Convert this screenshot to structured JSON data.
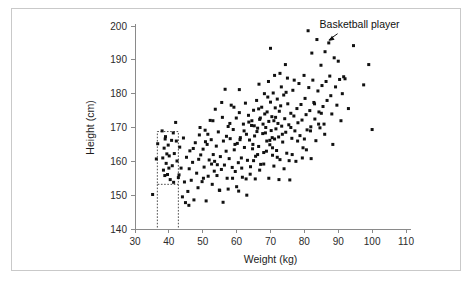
{
  "chart_data": {
    "type": "scatter",
    "title": "",
    "xlabel": "Weight (kg)",
    "ylabel": "Height (cm)",
    "xlim": [
      30,
      110
    ],
    "ylim": [
      140,
      200
    ],
    "xticks": [
      30,
      40,
      50,
      60,
      70,
      80,
      90,
      100,
      110
    ],
    "yticks": [
      140,
      150,
      160,
      170,
      180,
      190,
      200
    ],
    "grid": false,
    "legend": null,
    "point_color": "#111111",
    "point_size_px": 2.1,
    "annotations": [
      {
        "label": "Basketball player",
        "text_x": 84.5,
        "text_y": 199.5,
        "target_x": 87.2,
        "target_y": 195.0
      }
    ],
    "selection_box": {
      "name": "dotted-selection-rectangle",
      "x_range": [
        36.6,
        42.8
      ],
      "y_range": [
        153.2,
        168.8
      ],
      "drop_line_x": 36.6,
      "drop_line_to_y": 140
    },
    "points": [
      [
        35.2,
        150.2
      ],
      [
        36.3,
        160.7
      ],
      [
        36.7,
        165.2
      ],
      [
        38.0,
        169.0
      ],
      [
        38.2,
        161.0
      ],
      [
        38.4,
        157.4
      ],
      [
        38.6,
        163.9
      ],
      [
        38.8,
        155.8
      ],
      [
        39.0,
        167.3
      ],
      [
        39.2,
        159.4
      ],
      [
        39.6,
        156.1
      ],
      [
        39.8,
        164.8
      ],
      [
        40.1,
        161.6
      ],
      [
        40.4,
        154.6
      ],
      [
        40.8,
        166.2
      ],
      [
        41.0,
        158.7
      ],
      [
        41.3,
        168.4
      ],
      [
        41.6,
        162.3
      ],
      [
        42.0,
        171.5
      ],
      [
        42.4,
        160.1
      ],
      [
        42.8,
        155.2
      ],
      [
        43.2,
        164.2
      ],
      [
        43.6,
        158.0
      ],
      [
        44.0,
        149.5
      ],
      [
        44.3,
        166.9
      ],
      [
        44.6,
        153.9
      ],
      [
        44.9,
        147.8
      ],
      [
        45.2,
        161.2
      ],
      [
        45.6,
        151.1
      ],
      [
        45.9,
        147.0
      ],
      [
        46.2,
        163.1
      ],
      [
        46.6,
        154.4
      ],
      [
        47.0,
        159.7
      ],
      [
        47.4,
        148.6
      ],
      [
        47.8,
        165.5
      ],
      [
        48.2,
        156.5
      ],
      [
        48.6,
        152.2
      ],
      [
        49.0,
        167.8
      ],
      [
        49.4,
        161.9
      ],
      [
        49.8,
        154.0
      ],
      [
        50.1,
        163.6
      ],
      [
        50.4,
        158.3
      ],
      [
        50.7,
        169.2
      ],
      [
        51.0,
        148.3
      ],
      [
        51.3,
        165.0
      ],
      [
        51.6,
        155.6
      ],
      [
        51.9,
        160.4
      ],
      [
        52.2,
        172.1
      ],
      [
        52.5,
        166.4
      ],
      [
        52.8,
        153.2
      ],
      [
        53.1,
        162.0
      ],
      [
        53.4,
        157.1
      ],
      [
        53.7,
        175.4
      ],
      [
        54.0,
        164.5
      ],
      [
        54.3,
        159.0
      ],
      [
        54.6,
        168.7
      ],
      [
        54.9,
        151.5
      ],
      [
        55.2,
        161.4
      ],
      [
        55.5,
        157.6
      ],
      [
        55.8,
        173.0
      ],
      [
        56.1,
        166.0
      ],
      [
        56.4,
        158.9
      ],
      [
        56.6,
        181.3
      ],
      [
        56.9,
        163.0
      ],
      [
        57.2,
        155.0
      ],
      [
        57.5,
        170.3
      ],
      [
        57.8,
        160.8
      ],
      [
        58.1,
        166.7
      ],
      [
        58.4,
        176.6
      ],
      [
        58.7,
        158.2
      ],
      [
        59.0,
        169.4
      ],
      [
        59.3,
        163.4
      ],
      [
        59.6,
        157.0
      ],
      [
        59.9,
        172.8
      ],
      [
        60.2,
        165.3
      ],
      [
        60.5,
        159.6
      ],
      [
        60.8,
        174.4
      ],
      [
        61.1,
        167.0
      ],
      [
        61.4,
        161.0
      ],
      [
        61.7,
        155.3
      ],
      [
        62.0,
        171.0
      ],
      [
        62.3,
        164.1
      ],
      [
        62.6,
        177.2
      ],
      [
        62.9,
        168.0
      ],
      [
        63.2,
        160.3
      ],
      [
        63.5,
        173.6
      ],
      [
        63.8,
        166.3
      ],
      [
        64.1,
        158.4
      ],
      [
        64.4,
        170.6
      ],
      [
        64.7,
        163.7
      ],
      [
        65.0,
        175.1
      ],
      [
        65.3,
        167.5
      ],
      [
        65.6,
        161.5
      ],
      [
        65.9,
        178.0
      ],
      [
        66.2,
        169.8
      ],
      [
        66.5,
        164.4
      ],
      [
        66.8,
        172.4
      ],
      [
        67.1,
        159.1
      ],
      [
        67.4,
        176.0
      ],
      [
        67.7,
        168.2
      ],
      [
        68.0,
        162.6
      ],
      [
        68.3,
        174.0
      ],
      [
        68.6,
        170.0
      ],
      [
        68.9,
        166.0
      ],
      [
        69.2,
        179.0
      ],
      [
        69.5,
        171.8
      ],
      [
        69.8,
        164.9
      ],
      [
        70.0,
        177.5
      ],
      [
        70.2,
        169.1
      ],
      [
        70.4,
        173.2
      ],
      [
        70.6,
        161.8
      ],
      [
        70.8,
        180.2
      ],
      [
        71.0,
        172.0
      ],
      [
        71.2,
        166.6
      ],
      [
        71.4,
        175.8
      ],
      [
        71.6,
        169.6
      ],
      [
        71.8,
        163.2
      ],
      [
        72.0,
        178.4
      ],
      [
        72.2,
        171.2
      ],
      [
        72.4,
        167.2
      ],
      [
        72.6,
        174.8
      ],
      [
        72.8,
        160.5
      ],
      [
        73.0,
        176.4
      ],
      [
        73.3,
        170.4
      ],
      [
        73.6,
        165.7
      ],
      [
        73.9,
        179.6
      ],
      [
        74.2,
        172.6
      ],
      [
        74.5,
        168.6
      ],
      [
        74.8,
        162.4
      ],
      [
        75.1,
        177.0
      ],
      [
        75.4,
        170.8
      ],
      [
        75.7,
        154.5
      ],
      [
        76.0,
        174.2
      ],
      [
        76.3,
        166.8
      ],
      [
        76.6,
        181.0
      ],
      [
        76.9,
        173.4
      ],
      [
        77.2,
        169.0
      ],
      [
        77.5,
        160.0
      ],
      [
        77.8,
        175.6
      ],
      [
        78.1,
        171.4
      ],
      [
        78.4,
        183.0
      ],
      [
        78.7,
        167.6
      ],
      [
        79.0,
        176.8
      ],
      [
        79.3,
        172.2
      ],
      [
        79.6,
        164.0
      ],
      [
        79.9,
        185.4
      ],
      [
        80.2,
        178.6
      ],
      [
        80.5,
        173.8
      ],
      [
        80.8,
        169.3
      ],
      [
        81.1,
        198.6
      ],
      [
        81.3,
        181.8
      ],
      [
        81.6,
        175.0
      ],
      [
        81.9,
        170.2
      ],
      [
        82.2,
        192.0
      ],
      [
        82.5,
        184.0
      ],
      [
        82.8,
        177.4
      ],
      [
        83.1,
        172.5
      ],
      [
        83.4,
        166.1
      ],
      [
        83.7,
        196.0
      ],
      [
        84.0,
        180.8
      ],
      [
        84.3,
        174.6
      ],
      [
        84.6,
        169.9
      ],
      [
        84.9,
        188.4
      ],
      [
        85.2,
        182.4
      ],
      [
        85.5,
        176.2
      ],
      [
        85.8,
        171.0
      ],
      [
        86.1,
        192.4
      ],
      [
        86.4,
        183.6
      ],
      [
        86.7,
        178.0
      ],
      [
        87.2,
        195.0
      ],
      [
        87.5,
        185.2
      ],
      [
        87.8,
        179.4
      ],
      [
        88.1,
        174.0
      ],
      [
        88.4,
        165.0
      ],
      [
        88.8,
        190.6
      ],
      [
        89.2,
        182.0
      ],
      [
        89.6,
        176.6
      ],
      [
        90.0,
        189.6
      ],
      [
        90.4,
        184.2
      ],
      [
        90.8,
        172.0
      ],
      [
        91.2,
        180.0
      ],
      [
        91.6,
        185.0
      ],
      [
        92.0,
        184.4
      ],
      [
        93.0,
        175.6
      ],
      [
        94.5,
        194.2
      ],
      [
        97.5,
        182.6
      ],
      [
        99.0,
        188.6
      ],
      [
        100.0,
        169.4
      ],
      [
        53.5,
        160.0
      ],
      [
        54.2,
        155.8
      ],
      [
        55.0,
        151.4
      ],
      [
        56.0,
        147.9
      ],
      [
        57.5,
        151.8
      ],
      [
        58.8,
        155.0
      ],
      [
        60.0,
        152.5
      ],
      [
        61.5,
        158.0
      ],
      [
        62.8,
        154.8
      ],
      [
        64.0,
        156.2
      ],
      [
        65.5,
        154.8
      ],
      [
        66.8,
        157.4
      ],
      [
        68.0,
        159.2
      ],
      [
        69.5,
        155.0
      ],
      [
        71.0,
        158.6
      ],
      [
        72.5,
        154.6
      ],
      [
        74.0,
        157.8
      ],
      [
        75.5,
        160.2
      ],
      [
        63.0,
        150.0
      ],
      [
        60.6,
        151.2
      ],
      [
        46.0,
        157.8
      ],
      [
        47.2,
        163.8
      ],
      [
        48.8,
        160.6
      ],
      [
        50.2,
        155.0
      ],
      [
        51.5,
        168.0
      ],
      [
        52.6,
        159.2
      ],
      [
        43.0,
        156.0
      ],
      [
        42.2,
        166.0
      ],
      [
        41.4,
        153.8
      ],
      [
        40.0,
        158.0
      ],
      [
        39.4,
        162.2
      ],
      [
        38.9,
        166.6
      ],
      [
        64.5,
        172.0
      ],
      [
        65.2,
        170.5
      ],
      [
        66.0,
        168.8
      ],
      [
        67.0,
        172.8
      ],
      [
        68.5,
        168.4
      ],
      [
        69.0,
        174.6
      ],
      [
        70.5,
        167.0
      ],
      [
        71.5,
        173.0
      ],
      [
        73.5,
        168.0
      ],
      [
        66.5,
        175.5
      ],
      [
        67.8,
        171.0
      ],
      [
        69.8,
        166.2
      ],
      [
        64.8,
        165.0
      ],
      [
        62.2,
        169.0
      ],
      [
        63.6,
        171.6
      ],
      [
        61.0,
        166.4
      ],
      [
        59.5,
        165.0
      ],
      [
        58.0,
        171.2
      ],
      [
        57.0,
        167.4
      ],
      [
        74.6,
        180.4
      ],
      [
        76.0,
        170.0
      ],
      [
        78.0,
        166.0
      ],
      [
        80.0,
        166.6
      ],
      [
        81.8,
        169.0
      ],
      [
        83.0,
        177.0
      ],
      [
        85.0,
        174.2
      ],
      [
        86.0,
        168.0
      ],
      [
        77.0,
        184.0
      ],
      [
        75.0,
        184.6
      ],
      [
        73.2,
        182.0
      ],
      [
        71.2,
        185.4
      ],
      [
        69.4,
        183.6
      ],
      [
        68.2,
        180.0
      ],
      [
        66.6,
        182.8
      ],
      [
        70.0,
        193.4
      ],
      [
        72.8,
        186.0
      ],
      [
        74.4,
        188.6
      ],
      [
        59.2,
        176.0
      ],
      [
        60.8,
        181.2
      ],
      [
        55.6,
        177.4
      ],
      [
        53.0,
        172.0
      ],
      [
        50.8,
        165.8
      ],
      [
        49.2,
        170.0
      ],
      [
        65.0,
        160.2
      ],
      [
        66.2,
        162.0
      ],
      [
        68.8,
        163.0
      ],
      [
        72.0,
        161.2
      ],
      [
        70.6,
        164.0
      ],
      [
        76.4,
        162.0
      ],
      [
        79.4,
        161.0
      ],
      [
        80.6,
        163.4
      ],
      [
        82.0,
        160.8
      ],
      [
        84.2,
        171.0
      ]
    ]
  },
  "axes": {
    "x_tick_labels": [
      "30",
      "40",
      "50",
      "60",
      "70",
      "80",
      "90",
      "100",
      "110"
    ],
    "y_tick_labels": [
      "140",
      "150",
      "160",
      "170",
      "180",
      "190",
      "200"
    ],
    "x_title": "Weight (kg)",
    "y_title": "Height (cm)"
  },
  "annotation": {
    "label": "Basketball player"
  }
}
